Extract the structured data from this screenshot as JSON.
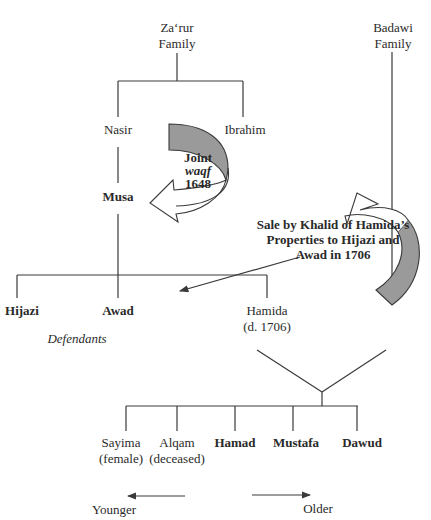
{
  "families": {
    "zarur": {
      "line1": "Za‘rur",
      "line2": "Family"
    },
    "badawi": {
      "line1": "Badawi",
      "line2": "Family"
    }
  },
  "generation1": {
    "nasir": "Nasir",
    "ibrahim": "Ibrahim"
  },
  "generation2": {
    "musa": "Musa"
  },
  "joint_waqf": {
    "line1": "Joint",
    "line2": "waqf",
    "line3": "1648"
  },
  "sale_note": {
    "line1": "Sale by Khalid of Hamida’s",
    "line2": "Properties to Hijazi and",
    "line3": "Awad in 1706"
  },
  "generation3": {
    "hijazi": "Hijazi",
    "awad": "Awad",
    "hamida": "Hamida",
    "hamida_note": "(d. 1706)",
    "defendants_label": "Defendants"
  },
  "children": [
    {
      "name": "Sayima",
      "note": "(female)",
      "bold": false
    },
    {
      "name": "Alqam",
      "note": "(deceased)",
      "bold": false
    },
    {
      "name": "Hamad",
      "note": "",
      "bold": true
    },
    {
      "name": "Mustafa",
      "note": "",
      "bold": true
    },
    {
      "name": "Dawud",
      "note": "",
      "bold": true
    }
  ],
  "age_legend": {
    "younger": "Younger",
    "older": "Older"
  },
  "colors": {
    "line": "#3a3a3a",
    "arrow_fill_shaded": "#9a9a9a",
    "arrow_fill_blank": "#ffffff",
    "text": "#2a2a2a"
  }
}
